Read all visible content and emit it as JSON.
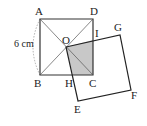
{
  "diagram": {
    "points": {
      "A": {
        "label": "A",
        "x": 40,
        "y": 19
      },
      "D": {
        "label": "D",
        "x": 93,
        "y": 19
      },
      "B": {
        "label": "B",
        "x": 40,
        "y": 75
      },
      "C": {
        "label": "C",
        "x": 93,
        "y": 75
      },
      "O": {
        "label": "O",
        "x": 66,
        "y": 47
      },
      "G": {
        "label": "G",
        "x": 120,
        "y": 35
      },
      "F": {
        "label": "F",
        "x": 131,
        "y": 90
      },
      "E": {
        "label": "E",
        "x": 78,
        "y": 101
      },
      "I": {
        "label": "I",
        "x": 93,
        "y": 40
      },
      "H": {
        "label": "H",
        "x": 73,
        "y": 75
      }
    },
    "side_label": "6 cm",
    "colors": {
      "line": "#333333",
      "shade": "#c8c8c8",
      "dashed": "#999999"
    }
  }
}
